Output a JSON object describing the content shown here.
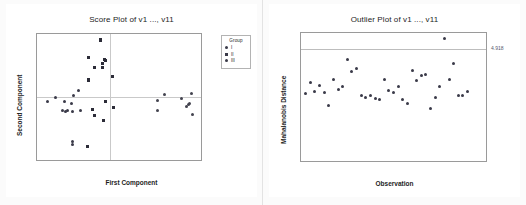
{
  "charts": [
    {
      "id": "score-plot",
      "title": "Score Plot of v1 ..., v11",
      "xlabel": "First Component",
      "ylabel": "Second Component",
      "xticks": [
        "-4",
        "-3",
        "-2",
        "-1",
        "0",
        "1",
        "2",
        "3",
        "4",
        "5"
      ],
      "yticks": [
        "3",
        "2",
        "1",
        "0",
        "-1",
        "-2",
        "-3"
      ],
      "legend": {
        "title": "Group",
        "items": [
          {
            "label": "I",
            "marker": "circle"
          },
          {
            "label": "II",
            "marker": "square"
          },
          {
            "label": "III",
            "marker": "circle"
          }
        ]
      }
    },
    {
      "id": "outlier-plot",
      "title": "Outlier Plot of v1 ..., v11",
      "xlabel": "Observation",
      "ylabel": "Mahalanobis Distance",
      "xticks": [
        "0",
        "10",
        "20",
        "30",
        "40"
      ],
      "yticks": [
        "5",
        "4",
        "3",
        "2",
        "1",
        "0"
      ],
      "reference_label": "4.918"
    }
  ],
  "chart_data": [
    {
      "type": "scatter",
      "title": "Score Plot of v1 ..., v11",
      "xlabel": "First Component",
      "ylabel": "Second Component",
      "xlim": [
        -4,
        5
      ],
      "ylim": [
        -3,
        3
      ],
      "xticks": [
        -4,
        -3,
        -2,
        -1,
        0,
        1,
        2,
        3,
        4,
        5
      ],
      "yticks": [
        -3,
        -2,
        -1,
        0,
        1,
        2,
        3
      ],
      "grid": false,
      "zero_lines": true,
      "legend": {
        "title": "Group",
        "position": "right-outside",
        "entries": [
          "I",
          "II",
          "III"
        ]
      },
      "series": [
        {
          "name": "I",
          "points": [
            [
              -3.4,
              -0.2
            ],
            [
              -3.0,
              0.0
            ],
            [
              -2.6,
              -0.65
            ],
            [
              -2.5,
              -0.2
            ],
            [
              -2.45,
              -0.7
            ],
            [
              -2.3,
              -0.65
            ],
            [
              -2.1,
              -0.3
            ],
            [
              -2.05,
              -0.7
            ],
            [
              -2.0,
              0.05
            ],
            [
              -2.05,
              -2.1
            ],
            [
              -2.05,
              -2.25
            ],
            [
              -1.75,
              0.3
            ],
            [
              -1.6,
              -0.65
            ]
          ]
        },
        {
          "name": "II",
          "points": [
            [
              -1.15,
              1.9
            ],
            [
              -1.2,
              0.8
            ],
            [
              -1.15,
              0.82
            ],
            [
              -0.85,
              1.4
            ],
            [
              -0.5,
              2.75
            ],
            [
              -0.5,
              2.68
            ],
            [
              -0.4,
              1.6
            ],
            [
              -0.4,
              1.4
            ],
            [
              -0.3,
              1.8
            ],
            [
              -0.25,
              1.75
            ],
            [
              -0.25,
              -0.2
            ],
            [
              0.15,
              1.0
            ],
            [
              -0.95,
              -0.6
            ],
            [
              -0.85,
              -0.9
            ],
            [
              -0.35,
              -1.1
            ],
            [
              0.2,
              -0.5
            ],
            [
              -1.25,
              -2.35
            ]
          ]
        },
        {
          "name": "III",
          "points": [
            [
              2.6,
              -0.15
            ],
            [
              2.6,
              -0.65
            ],
            [
              3.0,
              0.1
            ],
            [
              3.95,
              -0.05
            ],
            [
              4.2,
              -0.45
            ],
            [
              4.3,
              -0.35
            ],
            [
              4.35,
              -0.3
            ],
            [
              4.5,
              0.15
            ],
            [
              4.55,
              -0.85
            ]
          ]
        }
      ]
    },
    {
      "type": "scatter",
      "title": "Outlier Plot of v1 ..., v11",
      "xlabel": "Observation",
      "ylabel": "Mahalanobis Distance",
      "xlim": [
        0,
        40
      ],
      "ylim": [
        0,
        5.6
      ],
      "xticks": [
        0,
        10,
        20,
        30,
        40
      ],
      "yticks": [
        0,
        1,
        2,
        3,
        4,
        5
      ],
      "grid": false,
      "reference_line": {
        "y": 4.918,
        "label": "4.918"
      },
      "points": [
        [
          1,
          2.95
        ],
        [
          2,
          3.45
        ],
        [
          3,
          3.05
        ],
        [
          4,
          3.3
        ],
        [
          5,
          2.98
        ],
        [
          6,
          2.42
        ],
        [
          7,
          3.55
        ],
        [
          8,
          3.12
        ],
        [
          9,
          3.25
        ],
        [
          10,
          4.45
        ],
        [
          11,
          3.9
        ],
        [
          12,
          4.05
        ],
        [
          13,
          2.85
        ],
        [
          14,
          2.78
        ],
        [
          15,
          2.88
        ],
        [
          16,
          2.72
        ],
        [
          17,
          2.68
        ],
        [
          18,
          3.55
        ],
        [
          19,
          3.08
        ],
        [
          20,
          2.98
        ],
        [
          21,
          3.28
        ],
        [
          22,
          2.68
        ],
        [
          23,
          2.5
        ],
        [
          24,
          3.98
        ],
        [
          25,
          3.52
        ],
        [
          26,
          3.72
        ],
        [
          27,
          3.78
        ],
        [
          28,
          2.28
        ],
        [
          29,
          2.78
        ],
        [
          30,
          3.25
        ],
        [
          31,
          5.35
        ],
        [
          32,
          3.55
        ],
        [
          33,
          4.25
        ],
        [
          34,
          2.85
        ],
        [
          35,
          2.88
        ],
        [
          36,
          3.05
        ]
      ]
    }
  ]
}
